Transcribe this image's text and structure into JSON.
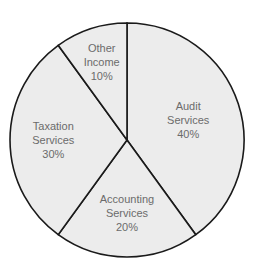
{
  "chart_data": {
    "type": "pie",
    "title": "",
    "start_angle_deg": 0,
    "direction": "clockwise",
    "slices": [
      {
        "label": "Audit Services",
        "value": 40,
        "text": [
          "Audit",
          "Services",
          "40%"
        ]
      },
      {
        "label": "Accounting Services",
        "value": 20,
        "text": [
          "Accounting",
          "Services",
          "20%"
        ]
      },
      {
        "label": "Taxation Services",
        "value": 30,
        "text": [
          "Taxation",
          "Services",
          "30%"
        ]
      },
      {
        "label": "Other Income",
        "value": 10,
        "text": [
          "Other",
          "Income",
          "10%"
        ]
      }
    ],
    "colors": {
      "fill": "#ececec",
      "stroke": "#1a1a1a",
      "label": "#6b6b6b"
    },
    "legend": "none"
  }
}
